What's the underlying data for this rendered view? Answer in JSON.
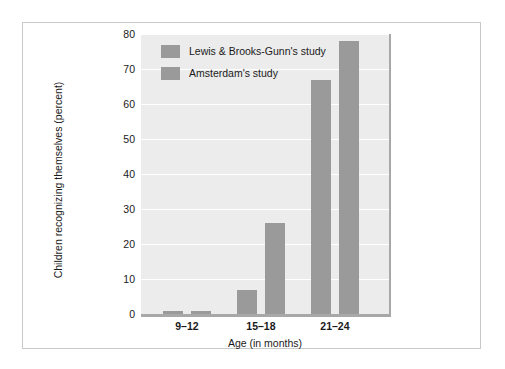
{
  "chart_data": {
    "type": "bar",
    "title": "",
    "xlabel": "Age (in months)",
    "ylabel": "Children recognizing themselves (percent)",
    "categories": [
      "9–12",
      "15–18",
      "21–24"
    ],
    "series": [
      {
        "name": "Lewis & Brooks-Gunn's study",
        "values": [
          1,
          7,
          67
        ],
        "color": "#9a9a9a"
      },
      {
        "name": "Amsterdam's study",
        "values": [
          1,
          26,
          78
        ],
        "color": "#9a9a9a"
      }
    ],
    "ylim": [
      0,
      80
    ],
    "yticks": [
      0,
      10,
      20,
      30,
      40,
      50,
      60,
      70,
      80
    ],
    "ytick_labels": [
      "0",
      "10",
      "20",
      "30",
      "40",
      "50",
      "60",
      "70",
      "80"
    ],
    "grid": "horizontal",
    "legend_position": "top-left-inside",
    "plot_background": "#ececec",
    "gridline_color": "#ffffff",
    "axis_color": "#a8a8a8",
    "frame_border_color": "#c9c9c9"
  },
  "legend": {
    "items": [
      {
        "label": "Lewis & Brooks-Gunn's study"
      },
      {
        "label": "Amsterdam's study"
      }
    ]
  },
  "axes": {
    "x_title": "Age (in months)",
    "y_title": "Children recognizing themselves (percent)"
  }
}
